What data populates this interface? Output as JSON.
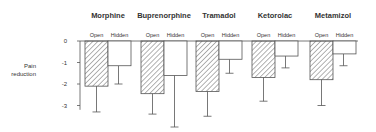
{
  "chart_data": {
    "type": "bar",
    "title": "",
    "xlabel": "",
    "ylabel": "Pain reduction",
    "ylabel_lines": [
      "Pain",
      "reduction"
    ],
    "ylim": [
      -4,
      0
    ],
    "yticks": [
      0,
      -1,
      -2,
      -3
    ],
    "ytick_labels": [
      "0",
      "-1",
      "-2",
      "-3"
    ],
    "grid": false,
    "legend": "none (condition labels above each bar)",
    "groups": [
      "Morphine",
      "Buprenorphine",
      "Tramadol",
      "Ketorolac",
      "Metamizol"
    ],
    "conditions": [
      "Open",
      "Hidden"
    ],
    "series": [
      {
        "name": "Open",
        "pattern": "hatched",
        "values": [
          -2.1,
          -2.45,
          -2.35,
          -1.7,
          -1.8
        ],
        "error_lower": [
          -3.3,
          -3.4,
          -3.5,
          -2.8,
          -3.0
        ]
      },
      {
        "name": "Hidden",
        "pattern": "white",
        "values": [
          -1.15,
          -1.6,
          -0.85,
          -0.7,
          -0.6
        ],
        "error_lower": [
          -2.0,
          -4.0,
          -1.5,
          -1.25,
          -1.15
        ]
      }
    ]
  },
  "colors": {
    "stroke": "#555555",
    "text": "#333333",
    "hatch": "#666666",
    "background": "#ffffff"
  }
}
